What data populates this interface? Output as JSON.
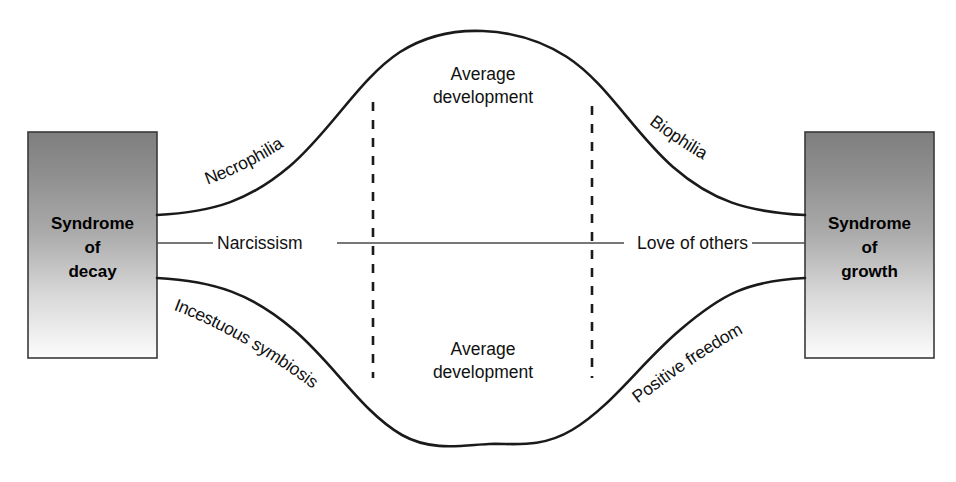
{
  "diagram": {
    "background_color": "#ffffff",
    "stroke_color": "#1a1a1a",
    "box_gradient_from": "#808080",
    "box_gradient_to": "#fbfbfb",
    "left_box": {
      "line1": "Syndrome",
      "line2": "of",
      "line3": "decay"
    },
    "right_box": {
      "line1": "Syndrome",
      "line2": "of",
      "line3": "growth"
    },
    "curve_labels": {
      "upper_left": "Necrophilia",
      "upper_right": "Biophilia",
      "lower_left": "Incestuous symbiosis",
      "lower_right": "Positive freedom"
    },
    "axis_labels": {
      "left": "Narcissism",
      "right": "Love of others"
    },
    "center_labels": {
      "upper_line1": "Average",
      "upper_line2": "development",
      "lower_line1": "Average",
      "lower_line2": "development"
    }
  }
}
